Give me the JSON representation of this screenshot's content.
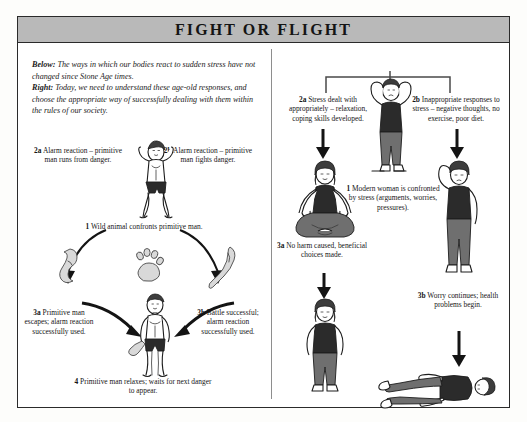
{
  "poster": {
    "title": "FIGHT OR FLIGHT",
    "title_bar_color": "#b9b9b9",
    "frame_color": "#2a2a2a",
    "background_color": "#ffffff"
  },
  "intro": {
    "below_label": "Below:",
    "below_text": " The ways in which our bodies react to sudden stress have not changed since Stone Age times.",
    "right_label": "Right:",
    "right_text": " Today, we need to understand these age-old responses, and choose the appropriate way of successfully dealing with them within the rules of our society."
  },
  "left_panel": {
    "name": "Stone Age response cycle",
    "captions": [
      {
        "id": "2a",
        "tag": "2a",
        "text": " Alarm reaction – primitive man runs from danger."
      },
      {
        "id": "2b",
        "tag": "2b",
        "text": " Alarm reaction – primitive man fights danger."
      },
      {
        "id": "1",
        "tag": "1",
        "text": " Wild animal confronts primitive man."
      },
      {
        "id": "3a",
        "tag": "3a",
        "text": " Primitive man escapes; alarm reaction successfully used."
      },
      {
        "id": "3b",
        "tag": "3b",
        "text": " Battle successful; alarm reaction successfully used."
      },
      {
        "id": "4",
        "tag": "4",
        "text": " Primitive man relaxes; waits for next danger to appear."
      }
    ],
    "figures": [
      {
        "name": "primitive-man-alarmed",
        "desc": "man with hands to head, dark shorts"
      },
      {
        "name": "running-leg-icon",
        "desc": "fleeing footprint / leg shape"
      },
      {
        "name": "animal-paw-print",
        "desc": "paw print of wild animal"
      },
      {
        "name": "club-icon",
        "desc": "wooden club"
      },
      {
        "name": "primitive-man-relaxed",
        "desc": "man standing relaxed holding club"
      }
    ]
  },
  "right_panel": {
    "name": "Modern stress response",
    "captions": [
      {
        "id": "2a",
        "tag": "2a",
        "text": " Stress dealt with appropriately – relaxation, coping skills developed."
      },
      {
        "id": "2b",
        "tag": "2b",
        "text": " Inappropriate responses to stress – negative thoughts, no exercise, poor diet."
      },
      {
        "id": "1",
        "tag": "1",
        "text": " Modern woman is confronted by stress (arguments, worries, pressures)."
      },
      {
        "id": "3a",
        "tag": "3a",
        "text": " No harm caused, beneficial choices made."
      },
      {
        "id": "3b",
        "tag": "3b",
        "text": " Worry continues; health problems begin."
      }
    ],
    "figures": [
      {
        "name": "modern-woman-stressed",
        "desc": "woman with hands to head, standing"
      },
      {
        "name": "modern-woman-meditating",
        "desc": "woman sitting cross-legged meditating"
      },
      {
        "name": "modern-woman-worried",
        "desc": "woman standing, hand to head, worried"
      },
      {
        "name": "modern-woman-collapsed",
        "desc": "woman lying down, ill"
      }
    ]
  }
}
